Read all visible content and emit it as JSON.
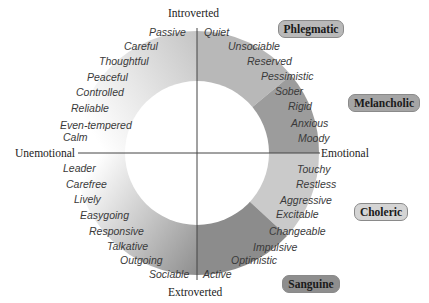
{
  "axes": {
    "top": "Introverted",
    "bottom": "Extroverted",
    "left": "Unemotional",
    "right": "Emotional"
  },
  "temperaments": [
    {
      "name": "Phlegmatic",
      "color": "#b9b9b9"
    },
    {
      "name": "Melancholic",
      "color": "#a5a5a5"
    },
    {
      "name": "Choleric",
      "color": "#d4d4d4"
    },
    {
      "name": "Sanguine",
      "color": "#8e8e8e"
    }
  ],
  "traits": {
    "upper_left": [
      "Passive",
      "Careful",
      "Thoughtful",
      "Peaceful",
      "Controlled",
      "Reliable",
      "Even-tempered",
      "Calm"
    ],
    "upper_right": [
      "Quiet",
      "Unsociable",
      "Reserved",
      "Pessimistic",
      "Sober",
      "Rigid",
      "Anxious",
      "Moody"
    ],
    "lower_right": [
      "Touchy",
      "Restless",
      "Aggressive",
      "Excitable",
      "Changeable",
      "Impulsive",
      "Optimistic",
      "Active"
    ],
    "lower_left": [
      "Leader",
      "Carefree",
      "Lively",
      "Easygoing",
      "Responsive",
      "Talkative",
      "Outgoing",
      "Sociable"
    ]
  },
  "colors": {
    "ring_upper_right": "#b8b8b8",
    "ring_melancholic": "#9c9c9c",
    "ring_choleric": "#cacaca",
    "ring_sanguine": "#8c8c8c",
    "axis_line": "#444444"
  }
}
